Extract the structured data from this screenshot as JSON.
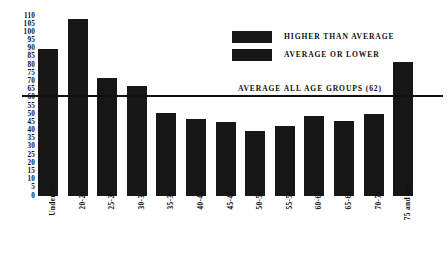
{
  "chart_data": {
    "type": "bar",
    "title": "",
    "xlabel": "",
    "ylabel": "",
    "ylim": [
      0,
      110
    ],
    "ytick_step": 5,
    "grid": false,
    "categories": [
      "Under 20",
      "20-24",
      "25-29",
      "30-34",
      "35-39",
      "40-44",
      "45-49",
      "50-54",
      "55-59",
      "60-64",
      "65-69",
      "70-74",
      "75 and over"
    ],
    "values": [
      90,
      108,
      72,
      67,
      51,
      47,
      45,
      40,
      43,
      49,
      46,
      50,
      82
    ],
    "yticks": [
      "110",
      "105",
      "100",
      "95",
      "90",
      "85",
      "80",
      "75",
      "70",
      "65",
      "60",
      "55",
      "50",
      "45",
      "40",
      "35",
      "30",
      "25",
      "20",
      "15",
      "10",
      "5",
      "0"
    ],
    "annotations": [
      {
        "name": "average-all-age-groups",
        "label": "AVERAGE ALL AGE GROUPS  (62)",
        "value": 62,
        "orientation": "horizontal-rule"
      }
    ],
    "legend": {
      "position": "top-right",
      "entries": [
        {
          "label": "HIGHER THAN AVERAGE",
          "color": "#171717"
        },
        {
          "label": "AVERAGE OR LOWER",
          "color": "#171717"
        }
      ]
    },
    "colors": {
      "bar": "#171717",
      "rule": "#111111",
      "text": "#111111",
      "background": "#ffffff"
    }
  }
}
